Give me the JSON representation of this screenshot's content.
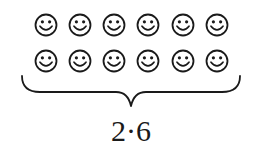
{
  "diagram": {
    "type": "grouping-brace",
    "icon": "smiley-face-icon",
    "rows": 2,
    "columns": 6,
    "total_items": 12,
    "expression": "2·6",
    "stroke_color": "#1a1a1a",
    "background": "#ffffff"
  }
}
